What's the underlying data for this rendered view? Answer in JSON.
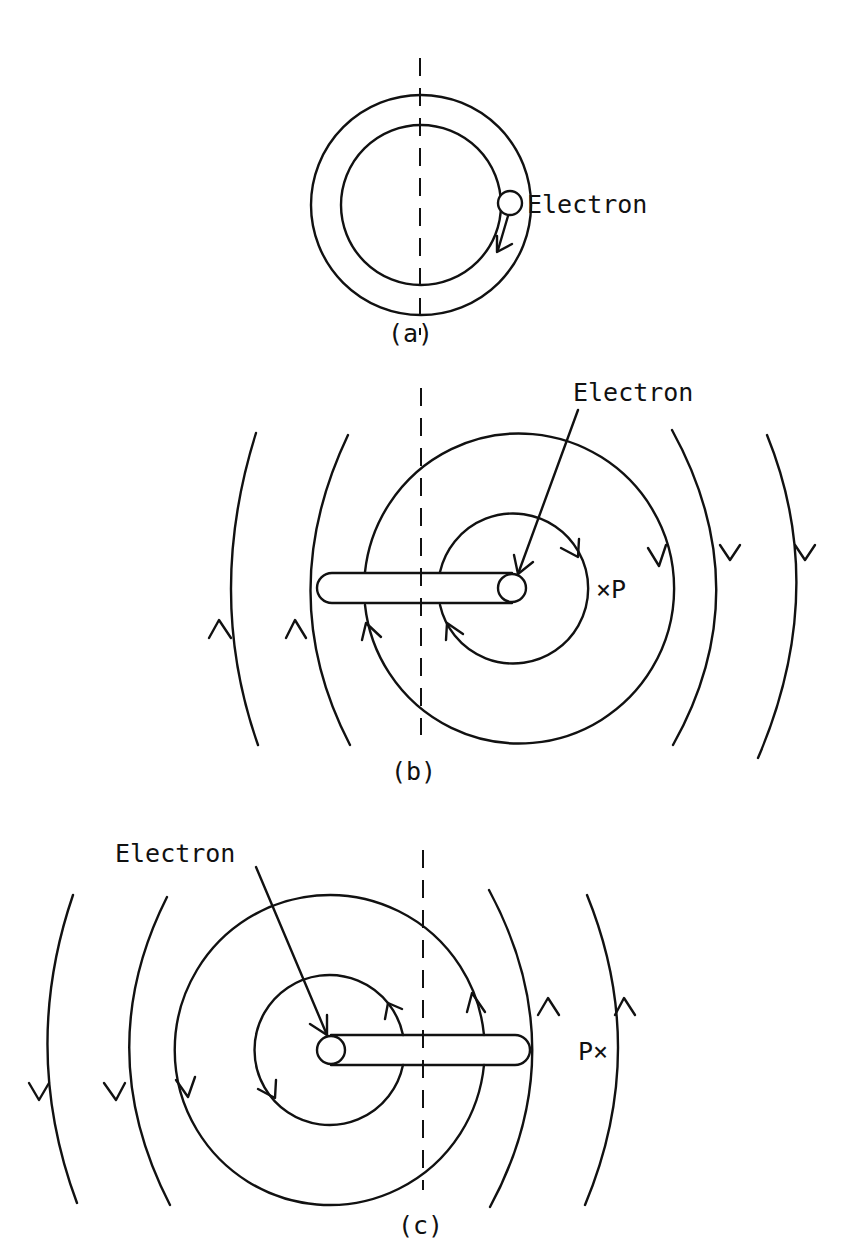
{
  "figure": {
    "panels": [
      {
        "id": "a",
        "caption": "(a)",
        "electron_label": "Electron",
        "description": "Electron orbiting in a ring between two concentric circles, with arrow indicating direction of motion"
      },
      {
        "id": "b",
        "caption": "(b)",
        "electron_label": "Electron",
        "point_label": "×P",
        "description": "Electron at right end of rod; field lines circulate clockwise around electron, point P to right"
      },
      {
        "id": "c",
        "caption": "(c)",
        "electron_label": "Electron",
        "point_label": "P×",
        "description": "Electron at left end of rod; field lines circulate counter-clockwise, point P to right"
      }
    ],
    "colors": {
      "line": "#111111",
      "background": "#ffffff"
    }
  }
}
